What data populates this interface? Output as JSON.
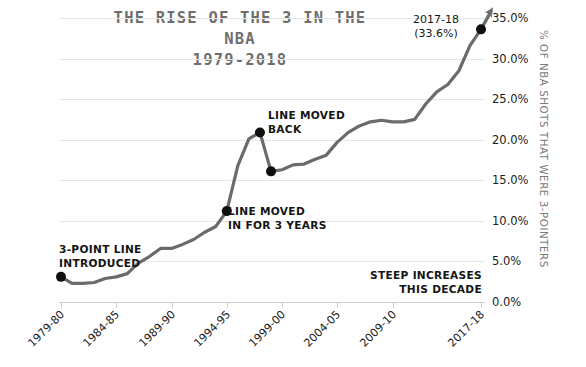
{
  "title": {
    "line1": "THE RISE OF THE 3 IN THE NBA",
    "line2": "1979-2018"
  },
  "axes": {
    "y_title": "% OF NBA SHOTS THAT WERE 3-POINTERS",
    "y_ticks": [
      "0.0%",
      "5.0%",
      "10.0%",
      "15.0%",
      "20.0%",
      "25.0%",
      "30.0%",
      "35.0%"
    ],
    "x_ticks": [
      "1979-80",
      "1984-85",
      "1989-90",
      "1994-95",
      "1999-00",
      "2004-05",
      "2009-10",
      "2017-18"
    ]
  },
  "annotations": {
    "three_point_intro": {
      "line1": "3-POINT LINE",
      "line2": "INTRODUCED"
    },
    "line_moved_in": {
      "line1": "LINE MOVED",
      "line2": "IN FOR 3 YEARS"
    },
    "line_moved_back": {
      "line1": "LINE MOVED",
      "line2": "BACK"
    },
    "steep_increases": {
      "line1": "STEEP INCREASES",
      "line2": "THIS DECADE"
    },
    "final_point": {
      "line1": "2017-18",
      "line2": "(33.6%)"
    }
  },
  "colors": {
    "line": "#6b6b6b",
    "marker": "#101010",
    "grid": "#e6e6e6",
    "title": "#6e6e6e",
    "axis_title": "#7a7a7a",
    "text": "#151515"
  },
  "chart_data": {
    "type": "line",
    "title": "THE RISE OF THE 3 IN THE NBA 1979-2018",
    "xlabel": "",
    "ylabel": "% OF NBA SHOTS THAT WERE 3-POINTERS",
    "ylim": [
      0,
      35
    ],
    "grid": true,
    "legend": "none",
    "categories": [
      "1979-80",
      "1980-81",
      "1981-82",
      "1982-83",
      "1983-84",
      "1984-85",
      "1985-86",
      "1986-87",
      "1987-88",
      "1988-89",
      "1989-90",
      "1990-91",
      "1991-92",
      "1992-93",
      "1993-94",
      "1994-95",
      "1995-96",
      "1996-97",
      "1997-98",
      "1998-99",
      "1999-00",
      "2000-01",
      "2001-02",
      "2002-03",
      "2003-04",
      "2004-05",
      "2005-06",
      "2006-07",
      "2007-08",
      "2008-09",
      "2009-10",
      "2010-11",
      "2011-12",
      "2012-13",
      "2013-14",
      "2014-15",
      "2015-16",
      "2016-17",
      "2017-18"
    ],
    "values": [
      3.1,
      2.3,
      2.3,
      2.4,
      2.9,
      3.1,
      3.5,
      4.8,
      5.6,
      6.6,
      6.6,
      7.1,
      7.7,
      8.6,
      9.3,
      11.2,
      16.8,
      20.1,
      20.9,
      16.1,
      16.3,
      16.9,
      17.0,
      17.6,
      18.1,
      19.7,
      20.9,
      21.7,
      22.2,
      22.4,
      22.2,
      22.2,
      22.5,
      24.4,
      25.9,
      26.8,
      28.5,
      31.6,
      33.6
    ],
    "markers": [
      {
        "category": "1979-80",
        "value": 3.1,
        "label": "3-POINT LINE INTRODUCED"
      },
      {
        "category": "1994-95",
        "value": 11.2,
        "label": "LINE MOVED IN FOR 3 YEARS"
      },
      {
        "category": "1997-98",
        "value": 20.9,
        "label": "LINE MOVED BACK"
      },
      {
        "category": "1998-99",
        "value": 16.1,
        "label": ""
      },
      {
        "category": "2017-18",
        "value": 33.6,
        "label": "2017-18 (33.6%)"
      }
    ],
    "notes": [
      "STEEP INCREASES THIS DECADE"
    ]
  }
}
